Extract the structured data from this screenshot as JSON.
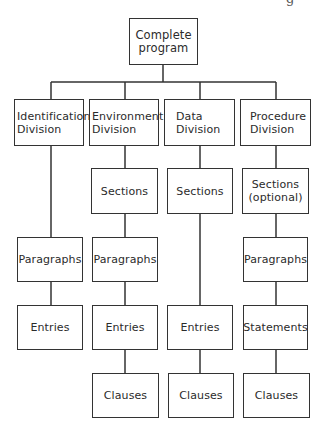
{
  "diagram": {
    "type": "hierarchy-tree",
    "colors": {
      "line": "#333333",
      "text": "#2b2b2b",
      "background": "#ffffff"
    },
    "corner_fragment": "g",
    "root": {
      "label": "Complete\nprogram"
    },
    "divisions": [
      {
        "label": "Identification\nDivision",
        "children": [
          "Paragraphs",
          "Entries"
        ]
      },
      {
        "label": "Environment\nDivision",
        "children": [
          "Sections",
          "Paragraphs",
          "Entries",
          "Clauses"
        ]
      },
      {
        "label": "Data\nDivision",
        "children": [
          "Sections",
          "Entries",
          "Clauses"
        ]
      },
      {
        "label": "Procedure\nDivision",
        "children": [
          "Sections\n(optional)",
          "Paragraphs",
          "Statements",
          "Clauses"
        ]
      }
    ]
  }
}
